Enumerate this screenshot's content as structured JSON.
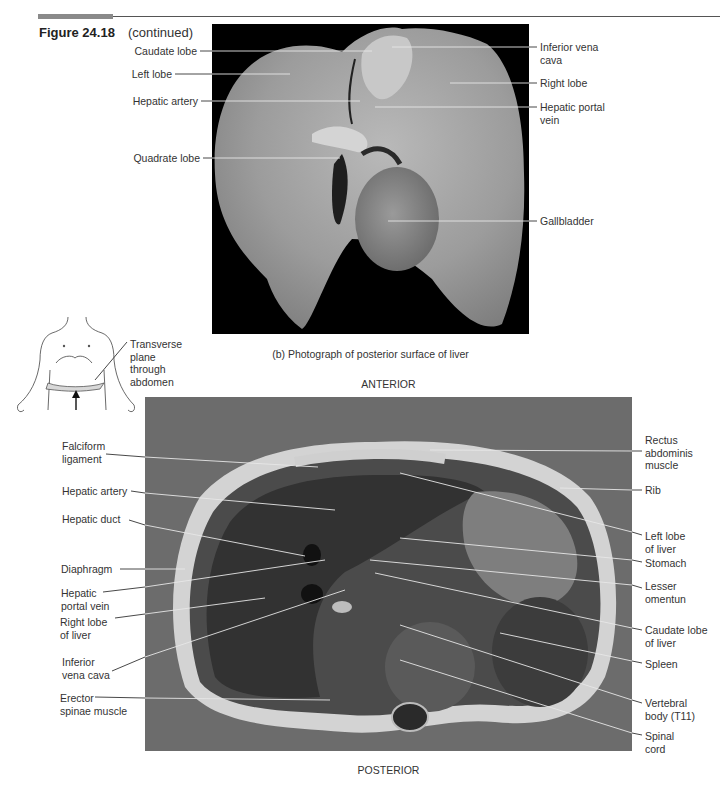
{
  "header": {
    "figure_number": "Figure 24.18",
    "continued": "(continued)"
  },
  "panel_b": {
    "caption": "(b) Photograph of posterior surface of liver",
    "labels_left": [
      {
        "text": "Caudate lobe",
        "y": 47
      },
      {
        "text": "Left lobe",
        "y": 70
      },
      {
        "text": "Hepatic artery",
        "y": 97
      },
      {
        "text": "Quadrate lobe",
        "y": 154
      }
    ],
    "labels_right": [
      {
        "text": "Inferior vena\ncava",
        "y": 43
      },
      {
        "text": "Right lobe",
        "y": 79
      },
      {
        "text": "Hepatic portal\nvein",
        "y": 103
      },
      {
        "text": "Gallbladder",
        "y": 193
      }
    ]
  },
  "orientation_icon": {
    "label": "Transverse\nplane\nthrough\nabdomen"
  },
  "panel_c": {
    "top_label": "ANTERIOR",
    "bottom_label": "POSTERIOR",
    "labels_left": [
      {
        "text": "Falciform\nligament"
      },
      {
        "text": "Hepatic artery"
      },
      {
        "text": "Hepatic duct"
      },
      {
        "text": "Diaphragm"
      },
      {
        "text": "Hepatic\nportal vein"
      },
      {
        "text": "Right lobe\nof liver"
      },
      {
        "text": "Inferior\nvena cava"
      },
      {
        "text": "Erector\nspinae muscle"
      }
    ],
    "labels_right": [
      {
        "text": "Rectus\nabdominis\nmuscle"
      },
      {
        "text": "Rib"
      },
      {
        "text": "Left lobe\nof liver"
      },
      {
        "text": "Stomach"
      },
      {
        "text": "Lesser\nomentun"
      },
      {
        "text": "Caudate lobe\nof liver"
      },
      {
        "text": "Spleen"
      },
      {
        "text": "Vertebral\nbody (T11)"
      },
      {
        "text": "Spinal\ncord"
      }
    ]
  }
}
